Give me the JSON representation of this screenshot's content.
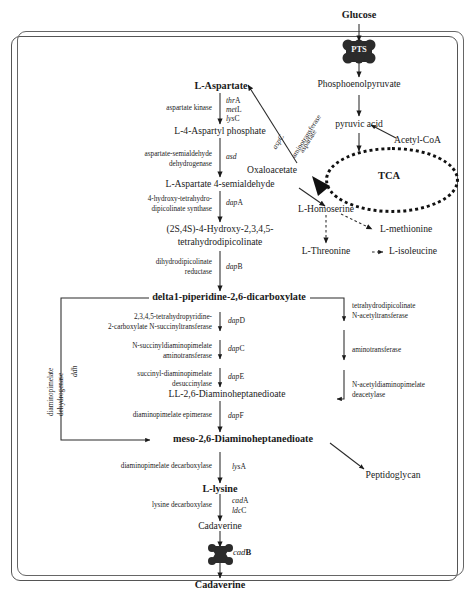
{
  "diagram": {
    "cell_boundary_label": "cell membrane",
    "transporters": [
      {
        "name": "PTS",
        "label": "PTS",
        "position": "top"
      },
      {
        "name": "cadB",
        "label_italic": "cad",
        "label_upper": "B",
        "position": "bottom"
      }
    ],
    "metabolites": {
      "glucose": "Glucose",
      "pep": "Phosphoenolpyruvate",
      "pyruvic_acid": "pyruvic acid",
      "acetyl_coa": "Acetyl-CoA",
      "tca": "TCA",
      "oxaloacetate": "Oxaloacetate",
      "l_aspartate": "L-Aspartate",
      "l4_aspartyl_phosphate": "L-4-Aspartyl phosphate",
      "l_aspartate_4_semialdehyde": "L-Aspartate 4-semialdehyde",
      "hydroxy_thdp_line1": "(2S,4S)-4-Hydroxy-2,3,4,5-",
      "hydroxy_thdp_line2": "tetrahydrodipicolinate",
      "l_homoserine": "L-Homoserine",
      "l_methionine": "L-methionine",
      "l_threonine": "L-Threonine",
      "l_isoleucine": "L-isoleucine",
      "delta1_piperidine": "delta1-piperidine-2,6-dicarboxylate",
      "ll_dap": "LL-2,6-Diaminoheptanedioate",
      "meso_dap": "meso-2,6-Diaminoheptanedioate",
      "peptidoglycan": "Peptidoglycan",
      "l_lysine": "L-lysine",
      "cadaverine_in": "Cadaverine",
      "cadaverine_out": "Cadaverine"
    },
    "enzymes": {
      "aspartate_kinase": "aspartate kinase",
      "asd_line1": "aspartate-semialdehyde",
      "asd_line2": "dehydrogenase",
      "dapA_line1": "4-hydroxy-tetrahydro-",
      "dapA_line2": "dipicolinate synthase",
      "dapB_line1": "dihydrodipicolinate",
      "dapB_line2": "reductase",
      "dapD_line1": "2,3,4,5-tetrahydropyridine-",
      "dapD_line2": "2-carboxylate N-succinyltransferase",
      "dapC_line1": "N-succinyldiaminopimelate",
      "dapC_line2": "aminotransferase",
      "dapE_line1": "succinyl-diaminopimelate",
      "dapE_line2": "desuccinylase",
      "dapF": "diaminopimelate epimerase",
      "lysA": "diaminopimelate decarboxylase",
      "cad_ldc": "lysine decarboxylase",
      "ddh_line1": "diaminopimelate",
      "ddh_line2": "dehydrogenase",
      "aspartate_aminotransferase_line1": "aspartate",
      "aspartate_aminotransferase_line2": "aminotransferase",
      "acetyl_line1": "tetrahydrodipicolinate",
      "acetyl_line2": "N-acetyltransferase",
      "aminotransferase": "aminotransferase",
      "deacetylase_line1": "N-acetyldiaminopimelate",
      "deacetylase_line2": "deacetylase"
    },
    "genes": {
      "thrA": {
        "italic": "thr",
        "upper": "A"
      },
      "metL": {
        "italic": "met",
        "upper": "L"
      },
      "lysC": {
        "italic": "lys",
        "upper": "C"
      },
      "asd": {
        "italic": "asd",
        "upper": ""
      },
      "dapA": {
        "italic": "dap",
        "upper": "A"
      },
      "dapB": {
        "italic": "dap",
        "upper": "B"
      },
      "dapD": {
        "italic": "dap",
        "upper": "D"
      },
      "dapC": {
        "italic": "dap",
        "upper": "C"
      },
      "dapE": {
        "italic": "dap",
        "upper": "E"
      },
      "dapF": {
        "italic": "dap",
        "upper": "F"
      },
      "lysA": {
        "italic": "lys",
        "upper": "A"
      },
      "cadA": {
        "italic": "cad",
        "upper": "A"
      },
      "ldcC": {
        "italic": "ldc",
        "upper": "C"
      },
      "aspC": {
        "italic": "asp",
        "upper": "C"
      },
      "ddh": {
        "italic": "ddh",
        "upper": ""
      },
      "cadB": {
        "italic": "cad",
        "upper": "B"
      }
    },
    "colors": {
      "line": "#2a2a2a",
      "text": "#1a1a1a",
      "membrane": "#555555",
      "transporter": "#2b2b2b",
      "background": "#ffffff"
    }
  }
}
